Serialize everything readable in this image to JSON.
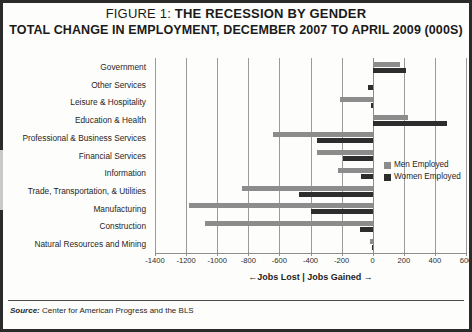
{
  "figure": {
    "title_prefix": "FIGURE 1:",
    "title_main": "THE RECESSION BY GENDER",
    "subtitle": "TOTAL CHANGE IN EMPLOYMENT, DECEMBER 2007 TO APRIL 2009 (000S)",
    "source_label": "Source:",
    "source_text": "Center for American Progress and the BLS"
  },
  "legend": {
    "position": "inside-right",
    "items": [
      {
        "label": "Men Employed",
        "color": "#8c8c8c",
        "name": "men-employed"
      },
      {
        "label": "Women Employed",
        "color": "#2d2d2d",
        "name": "women-employed"
      }
    ]
  },
  "axis": {
    "x_title": "←Jobs Lost | Jobs Gained →",
    "ticks": [
      "-1400",
      "-1200",
      "-1000",
      "-800",
      "-600",
      "-400",
      "-200",
      "0",
      "200",
      "400",
      "600"
    ]
  },
  "chart_data": {
    "type": "bar",
    "orientation": "horizontal",
    "xlabel": "←Jobs Lost | Jobs Gained →",
    "ylabel": "",
    "xlim": [
      -1400,
      600
    ],
    "xticks": [
      -1400,
      -1200,
      -1000,
      -800,
      -600,
      -400,
      -200,
      0,
      200,
      400,
      600
    ],
    "grid": true,
    "categories": [
      "Government",
      "Other Services",
      "Leisure & Hospitality",
      "Education & Health",
      "Professional & Business Services",
      "Financial Services",
      "Information",
      "Trade, Transportation, & Utilities",
      "Manufacturing",
      "Construction",
      "Natural Resources and Mining"
    ],
    "series": [
      {
        "name": "Men Employed",
        "color": "#8c8c8c",
        "values": [
          175,
          5,
          -210,
          230,
          -640,
          -360,
          -220,
          -840,
          -1180,
          -1080,
          -20
        ]
      },
      {
        "name": "Women Employed",
        "color": "#2d2d2d",
        "values": [
          215,
          -30,
          -10,
          480,
          -355,
          -190,
          -75,
          -475,
          -400,
          -80,
          -5
        ]
      }
    ]
  }
}
